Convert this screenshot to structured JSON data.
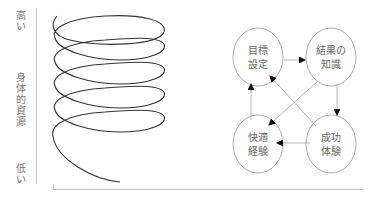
{
  "left_figure": {
    "axis_label": "身体的資源",
    "axis_label_chars": [
      "身",
      "体",
      "的",
      "資",
      "源"
    ],
    "top_label": "高い",
    "top_label_chars": [
      "高",
      "い"
    ],
    "bottom_label": "低い",
    "bottom_label_chars": [
      "低",
      "い"
    ],
    "shape": "descending-spiral",
    "loops": 5
  },
  "cycle_diagram": {
    "nodes": [
      {
        "id": "goal",
        "line1": "目標",
        "line2": "設定"
      },
      {
        "id": "knowledge",
        "line1": "結果の",
        "line2": "知識"
      },
      {
        "id": "comfort",
        "line1": "快適",
        "line2": "経験"
      },
      {
        "id": "success",
        "line1": "成功",
        "line2": "体験"
      }
    ],
    "edges": [
      {
        "from": "目標設定",
        "to": "結果の知識"
      },
      {
        "from": "結果の知識",
        "to": "成功体験"
      },
      {
        "from": "結果の知識",
        "to": "快適経験"
      },
      {
        "from": "成功体験",
        "to": "快適経験"
      },
      {
        "from": "成功体験",
        "to": "目標設定"
      },
      {
        "from": "快適経験",
        "to": "目標設定"
      }
    ]
  },
  "colors": {
    "line": "#333333",
    "node_border": "#9a9a9a",
    "arrow": "#999999",
    "axis": "#bdbdbd",
    "text": "#666666"
  }
}
